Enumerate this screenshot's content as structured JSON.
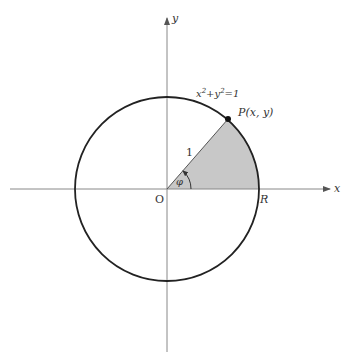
{
  "diagram": {
    "type": "unit-circle",
    "axes": {
      "x_label": "x",
      "y_label": "y",
      "origin_label": "O"
    },
    "circle": {
      "equation_lhs": "x",
      "equation_mid": "+y",
      "equation_rhs": "=1",
      "exponent": "2"
    },
    "point": {
      "label_name": "P",
      "label_coords": "(x, y)"
    },
    "radius_label": "1",
    "angle_label": "φ",
    "end_label": "R",
    "colors": {
      "sector_fill": "#c8c8c8",
      "circle_stroke": "#222222",
      "axis_stroke": "#777777"
    }
  }
}
